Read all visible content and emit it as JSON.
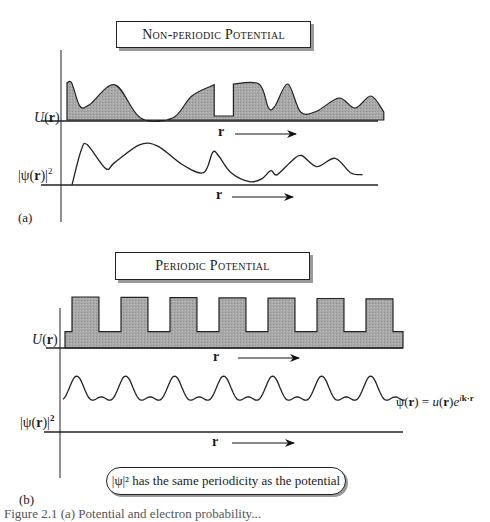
{
  "panel_a": {
    "tag": "(a)",
    "title": "Non-periodic Potential",
    "potential_label": "U(r)",
    "wavefunction_label": "|ψ(r)|²",
    "axis_label": "r",
    "potential_profile": [
      [
        0,
        0.93
      ],
      [
        0.015,
        0.92
      ],
      [
        0.04,
        0.35
      ],
      [
        0.07,
        0.38
      ],
      [
        0.15,
        0.88
      ],
      [
        0.23,
        0.05
      ],
      [
        0.33,
        0.05
      ],
      [
        0.39,
        0.6
      ],
      [
        0.46,
        0.88
      ],
      [
        0.46,
        0.1
      ],
      [
        0.52,
        0.1
      ],
      [
        0.52,
        0.9
      ],
      [
        0.6,
        0.9
      ],
      [
        0.63,
        0.3
      ],
      [
        0.65,
        0.35
      ],
      [
        0.69,
        0.9
      ],
      [
        0.73,
        0.2
      ],
      [
        0.78,
        0.22
      ],
      [
        0.85,
        0.55
      ],
      [
        0.9,
        0.3
      ],
      [
        0.95,
        0.6
      ],
      [
        0.99,
        0.2
      ]
    ],
    "probability_profile": [
      [
        0,
        0.0
      ],
      [
        0.03,
        0.85
      ],
      [
        0.05,
        0.98
      ],
      [
        0.11,
        0.4
      ],
      [
        0.14,
        0.55
      ],
      [
        0.22,
        0.98
      ],
      [
        0.28,
        0.95
      ],
      [
        0.36,
        0.5
      ],
      [
        0.43,
        0.3
      ],
      [
        0.46,
        0.8
      ],
      [
        0.48,
        0.7
      ],
      [
        0.52,
        0.3
      ],
      [
        0.58,
        0.08
      ],
      [
        0.62,
        0.15
      ],
      [
        0.65,
        0.35
      ],
      [
        0.67,
        0.25
      ],
      [
        0.72,
        0.6
      ],
      [
        0.75,
        0.72
      ],
      [
        0.8,
        0.45
      ],
      [
        0.86,
        0.65
      ],
      [
        0.91,
        0.3
      ],
      [
        0.95,
        0.25
      ]
    ]
  },
  "panel_b": {
    "tag": "(b)",
    "title": "Periodic Potential",
    "potential_label": "U(r)",
    "wavefunction_label": "|ψ(r)|²",
    "axis_label": "r",
    "barrier_count": 7,
    "barrier_duty_fraction": 0.55,
    "barrier_height_ratio": 0.32,
    "bloch_label": "ψ(r) = u(r)e^(ik·r)",
    "bloch_parts": {
      "lhs": "ψ(",
      "r": "r",
      "mid": ") = ",
      "u": "u",
      "paren_open": "(",
      "paren_close": ")",
      "e": "e",
      "exp": "ik·r"
    },
    "note": "|ψ|² has the same periodicity as the potential"
  },
  "caption": "Figure 2.1 (a) Potential and electron probability..."
}
